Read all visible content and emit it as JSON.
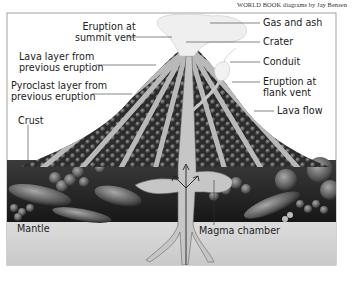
{
  "credit": "WORLD BOOK diagrams by Jay Bensen",
  "labels": {
    "summit_eruption_l1": "Eruption at",
    "summit_eruption_l2": "summit vent",
    "lava_layer_l1": "Lava layer from",
    "lava_layer_l2": "previous eruption",
    "pyroclast_l1": "Pyroclast layer from",
    "pyroclast_l2": "previous eruption",
    "crust": "Crust",
    "mantle": "Mantle",
    "gas_ash": "Gas and ash",
    "crater": "Crater",
    "conduit": "Conduit",
    "flank_eruption_l1": "Eruption at",
    "flank_eruption_l2": "flank vent",
    "lava_flow": "Lava flow",
    "magma_chamber": "Magma chamber"
  },
  "colors": {
    "frame": "#8a8a8a",
    "cone_dark": "#3a3a3a",
    "lava_band": "#b8b8b8",
    "crust_dark": "#2a2a2a",
    "mantle": "#d6d6d6",
    "magma": "#c4c4c4",
    "plume": "#eeeeee",
    "text": "#222222"
  }
}
